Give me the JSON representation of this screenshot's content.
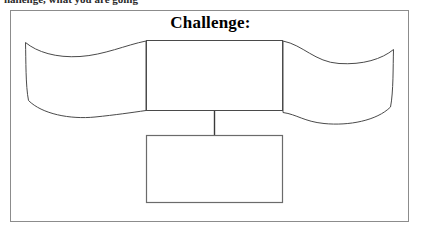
{
  "document": {
    "clipped_header_text": "hallenge, what you are going",
    "title": "Challenge:",
    "frame": {
      "border_color": "#8c8c8c",
      "background": "#ffffff"
    }
  },
  "diagram": {
    "type": "graphic-organizer",
    "stroke_color": "#4a4a4a",
    "fill_color": "#ffffff",
    "shapes": [
      {
        "name": "left-banner",
        "kind": "curved-ribbon",
        "text": "",
        "bounds": {
          "x": 24,
          "y": 40,
          "width": 122,
          "height": 80
        }
      },
      {
        "name": "center-box",
        "kind": "rectangle",
        "text": "",
        "bounds": {
          "x": 146,
          "y": 40,
          "width": 137,
          "height": 70
        }
      },
      {
        "name": "right-banner",
        "kind": "curved-ribbon",
        "text": "",
        "bounds": {
          "x": 283,
          "y": 40,
          "width": 111,
          "height": 80
        }
      },
      {
        "name": "bottom-box",
        "kind": "rectangle",
        "text": "",
        "bounds": {
          "x": 146,
          "y": 135,
          "width": 137,
          "height": 68
        }
      }
    ],
    "connectors": [
      {
        "name": "center-to-bottom-connector",
        "from": "center-box",
        "to": "bottom-box",
        "x": 214,
        "y1": 110,
        "y2": 135
      }
    ]
  }
}
